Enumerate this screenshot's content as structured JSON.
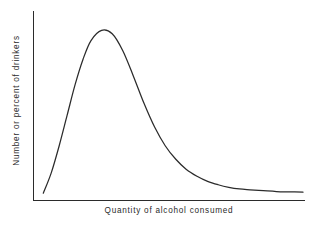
{
  "chart_data": {
    "type": "line",
    "title": "",
    "subtitle": "",
    "xlabel": "Quantity of alcohol consumed",
    "ylabel": "Number or percent of drinkers",
    "legend": [],
    "annotations": [],
    "grid": false,
    "legend_position": "none",
    "axis_ticks": false,
    "tick_labels_x": [],
    "tick_labels_y": [],
    "xlim": [
      0,
      100
    ],
    "ylim": [
      0,
      100
    ],
    "curve_color": "#2b2b2b",
    "axis_color": "#2b2b2b",
    "background_color": "#ffffff",
    "series": [
      {
        "name": "Distribution of drinkers",
        "x": [
          2,
          5,
          8,
          11,
          14,
          17,
          20,
          24,
          28,
          32,
          36,
          40,
          44,
          48,
          52,
          56,
          60,
          64,
          68,
          72,
          76,
          80,
          85,
          90,
          95,
          100
        ],
        "values": [
          2,
          14,
          30,
          48,
          66,
          81,
          92,
          98,
          96,
          86,
          71,
          55,
          41,
          30,
          22,
          16,
          12,
          9,
          7,
          5.5,
          4.5,
          4,
          3.5,
          3,
          2.8,
          2.6
        ]
      }
    ],
    "peak": {
      "x": 25,
      "y": 98
    }
  },
  "figure": {
    "x_axis_label": "Quantity of alcohol consumed",
    "y_axis_label": "Number or percent of drinkers"
  }
}
